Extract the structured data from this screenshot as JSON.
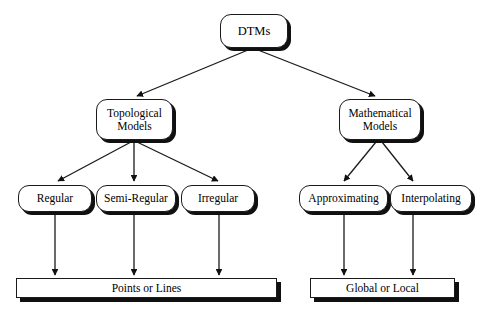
{
  "diagram": {
    "background_color": "#ffffff",
    "line_color": "#1a1a1a",
    "shadow_color": "#101010",
    "nodes": {
      "root": {
        "label": "DTMs"
      },
      "level2": [
        {
          "label": "Topological\nModels"
        },
        {
          "label": "Mathematical\nModels"
        }
      ],
      "level3_left": [
        {
          "label": "Regular"
        },
        {
          "label": "Semi-Regular"
        },
        {
          "label": "Irregular"
        }
      ],
      "level3_right": [
        {
          "label": "Approximating"
        },
        {
          "label": "Interpolating"
        }
      ],
      "level4": [
        {
          "label": "Points or Lines"
        },
        {
          "label": "Global or Local"
        }
      ]
    }
  }
}
